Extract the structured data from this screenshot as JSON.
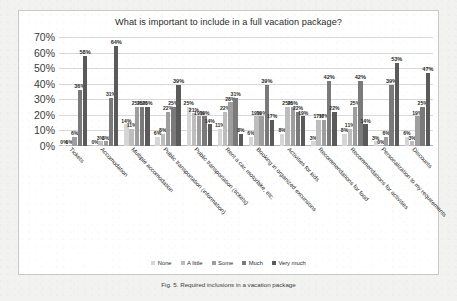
{
  "page": {
    "caption": "Fig. 5. Required inclusions in a vacation package"
  },
  "chart_data": {
    "type": "bar",
    "title": "What is important to include in a full vacation package?",
    "xlabel": "",
    "ylabel": "",
    "ylim": [
      0,
      70
    ],
    "yticks": [
      "0%",
      "10%",
      "20%",
      "30%",
      "40%",
      "50%",
      "60%",
      "70%"
    ],
    "grid": true,
    "legend_position": "bottom",
    "categories": [
      "Tickets",
      "Accomodation",
      "Multiple accomodation",
      "Public transportation (information)",
      "Public transportation (tickets)",
      "Rent a car, motorbike, etc.",
      "Booking in organized excursions",
      "Activities for kids",
      "Recommendations for food",
      "Recommendations for activities",
      "Personalization to my requirements",
      "Discounts"
    ],
    "series": [
      {
        "name": "None",
        "color": "#d6d6d6",
        "values": [
          0,
          0,
          14,
          6,
          25,
          11,
          6,
          8,
          3,
          8,
          3,
          6
        ],
        "labels": [
          "0%",
          "0%",
          "14%",
          "6%",
          "25%",
          "11%",
          "6%",
          "8%",
          "3%",
          "8%",
          "3%",
          "6%"
        ]
      },
      {
        "name": "A little",
        "color": "#bdbdbd",
        "values": [
          0,
          3,
          11,
          8,
          21,
          22,
          19,
          25,
          17,
          11,
          0,
          3
        ],
        "labels": [
          "0%",
          "3%",
          "11%",
          "8%",
          "21%",
          "22%",
          "19%",
          "25%",
          "17%",
          "11%",
          "0%",
          "3%"
        ]
      },
      {
        "name": "Some",
        "color": "#9e9e9e",
        "values": [
          6,
          3,
          25,
          22,
          19,
          28,
          19,
          25,
          17,
          25,
          6,
          19
        ],
        "labels": [
          "6%",
          "3%",
          "25%",
          "22%",
          "19%",
          "28%",
          "19%",
          "25%",
          "17%",
          "25%",
          "6%",
          "19%"
        ]
      },
      {
        "name": "Much",
        "color": "#7a7a7a",
        "values": [
          36,
          31,
          25,
          25,
          19,
          31,
          39,
          22,
          42,
          42,
          39,
          25
        ],
        "labels": [
          "36%",
          "31%",
          "25%",
          "25%",
          "19%",
          "31%",
          "39%",
          "22%",
          "42%",
          "42%",
          "39%",
          "25%"
        ]
      },
      {
        "name": "Very much",
        "color": "#5a5a5a",
        "values": [
          58,
          64,
          25,
          39,
          14,
          8,
          17,
          19,
          22,
          14,
          53,
          47
        ],
        "labels": [
          "58%",
          "64%",
          "25%",
          "39%",
          "14%",
          "8%",
          "17%",
          "19%",
          "22%",
          "14%",
          "53%",
          "47%"
        ]
      }
    ]
  }
}
